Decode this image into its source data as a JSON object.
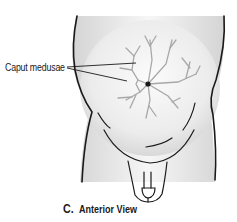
{
  "figure": {
    "label": "Caput medusae",
    "caption": {
      "letter": "C.",
      "title": "Anterior View"
    },
    "colors": {
      "outline": "#1a1a1a",
      "veins": "#a8a8a8",
      "skin_shade": "#e2e2e2",
      "background": "#ffffff"
    }
  }
}
